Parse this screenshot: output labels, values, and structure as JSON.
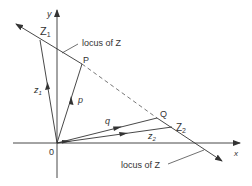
{
  "diagram": {
    "axes": {
      "x_label": "x",
      "y_label": "y",
      "origin_label": "0"
    },
    "points": {
      "Z1": {
        "label": "Z",
        "sub": "1"
      },
      "P": {
        "label": "P"
      },
      "Q": {
        "label": "Q"
      },
      "Z2": {
        "label": "Z",
        "sub": "2"
      }
    },
    "vectors": {
      "z1": {
        "label": "z",
        "sub": "1"
      },
      "p": {
        "label": "p"
      },
      "q": {
        "label": "q"
      },
      "z2": {
        "label": "z",
        "sub": "2"
      }
    },
    "annotations": {
      "locus_top": "locus of Z",
      "locus_bottom": "locus of Z"
    },
    "colors": {
      "line": "#333333",
      "dash": "#555555"
    }
  }
}
